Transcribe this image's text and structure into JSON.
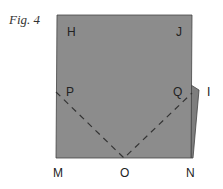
{
  "figure": {
    "label": "Fig. 4",
    "fill_color": "#8c8c8c",
    "points": {
      "H": "H",
      "J": "J",
      "P": "P",
      "Q": "Q",
      "I": "I",
      "M": "M",
      "O": "O",
      "N": "N"
    }
  }
}
